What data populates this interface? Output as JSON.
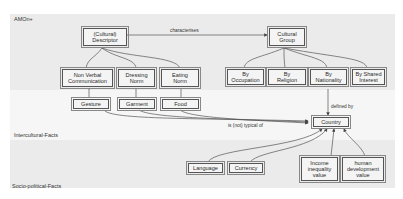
{
  "regions": {
    "top": "AMOn+",
    "middle": "Intercultural-Facts",
    "bottom": "Socio-political-Facts"
  },
  "nodes": {
    "cultural_descriptor": "(Cultural)\nDescriptor",
    "cultural_group": "Cultural\nGroup",
    "non_verbal_communication": "Non Verbal\nCommunication",
    "dressing_norm": "Dressing\nNorm",
    "eating_norm": "Eating\nNorm",
    "by_occupation": "By\nOccupation",
    "by_religion": "By\nReligion",
    "by_nationality": "By\nNationality",
    "by_shared_interest": "By Shared\nInterest",
    "gesture": "Gesture",
    "garment": "Garment",
    "food": "Food",
    "country": "Country",
    "language": "Language",
    "currency": "Currency",
    "income_inequality_value": "Income\ninequality\nvalue",
    "human_development_value": "human\ndevelopment\nvalue"
  },
  "edges": {
    "characterises": "characterises",
    "defined_by": "defined by",
    "is_not_typical_of": "is (not) typical of"
  },
  "colors": {
    "band_dark": "#ebebeb",
    "band_light": "#f6f6f6",
    "stroke": "#555555"
  }
}
